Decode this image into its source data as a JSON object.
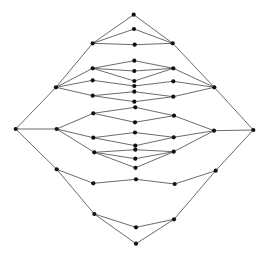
{
  "diagram": {
    "type": "lattice-graph",
    "colors": {
      "background": "#ffffff",
      "edge": "#5a5a5a",
      "node": "#111111"
    },
    "node_radius": 2.1,
    "nodes": [
      {
        "id": "n0",
        "x": 133.7,
        "y": 14.7
      },
      {
        "id": "n1",
        "x": 134.0,
        "y": 29.0
      },
      {
        "id": "n2",
        "x": 92.7,
        "y": 43.3
      },
      {
        "id": "n3",
        "x": 172.7,
        "y": 43.3
      },
      {
        "id": "n4",
        "x": 134.7,
        "y": 44.7
      },
      {
        "id": "n5",
        "x": 134.3,
        "y": 60.7
      },
      {
        "id": "n6",
        "x": 92.7,
        "y": 68.3
      },
      {
        "id": "n7",
        "x": 173.3,
        "y": 68.3
      },
      {
        "id": "n8",
        "x": 134.3,
        "y": 71.0
      },
      {
        "id": "n9",
        "x": 92.7,
        "y": 80.3
      },
      {
        "id": "n10",
        "x": 134.3,
        "y": 81.0
      },
      {
        "id": "n11",
        "x": 173.3,
        "y": 81.3
      },
      {
        "id": "n12",
        "x": 134.3,
        "y": 86.0
      },
      {
        "id": "n13",
        "x": 56.0,
        "y": 87.3
      },
      {
        "id": "n14",
        "x": 214.3,
        "y": 87.3
      },
      {
        "id": "n15",
        "x": 134.3,
        "y": 91.7
      },
      {
        "id": "n16",
        "x": 92.7,
        "y": 95.7
      },
      {
        "id": "n17",
        "x": 173.3,
        "y": 96.7
      },
      {
        "id": "n18",
        "x": 134.3,
        "y": 101.7
      },
      {
        "id": "n19",
        "x": 135.3,
        "y": 107.3
      },
      {
        "id": "n20",
        "x": 93.3,
        "y": 113.3
      },
      {
        "id": "n21",
        "x": 174.0,
        "y": 115.7
      },
      {
        "id": "n22",
        "x": 135.0,
        "y": 122.3
      },
      {
        "id": "n23",
        "x": 15.7,
        "y": 129.0
      },
      {
        "id": "n24",
        "x": 56.7,
        "y": 129.0
      },
      {
        "id": "n25",
        "x": 214.0,
        "y": 130.7
      },
      {
        "id": "n26",
        "x": 253.3,
        "y": 130.0
      },
      {
        "id": "n27",
        "x": 135.0,
        "y": 132.5
      },
      {
        "id": "n28",
        "x": 93.3,
        "y": 137.7
      },
      {
        "id": "n29",
        "x": 173.7,
        "y": 137.3
      },
      {
        "id": "n30",
        "x": 135.3,
        "y": 145.7
      },
      {
        "id": "n31",
        "x": 135.3,
        "y": 149.7
      },
      {
        "id": "n32",
        "x": 94.3,
        "y": 152.3
      },
      {
        "id": "n33",
        "x": 173.7,
        "y": 151.7
      },
      {
        "id": "n34",
        "x": 135.3,
        "y": 158.7
      },
      {
        "id": "n35",
        "x": 135.5,
        "y": 167.8
      },
      {
        "id": "n36",
        "x": 56.7,
        "y": 169.3
      },
      {
        "id": "n37",
        "x": 215.7,
        "y": 170.7
      },
      {
        "id": "n38",
        "x": 136.0,
        "y": 179.3
      },
      {
        "id": "n39",
        "x": 93.3,
        "y": 183.3
      },
      {
        "id": "n40",
        "x": 174.7,
        "y": 184.0
      },
      {
        "id": "n41",
        "x": 94.3,
        "y": 214.0
      },
      {
        "id": "n42",
        "x": 174.0,
        "y": 219.3
      },
      {
        "id": "n43",
        "x": 136.0,
        "y": 227.3
      },
      {
        "id": "n44",
        "x": 136.0,
        "y": 243.7
      }
    ],
    "edges": [
      [
        "n0",
        "n2"
      ],
      [
        "n0",
        "n3"
      ],
      [
        "n1",
        "n2"
      ],
      [
        "n1",
        "n3"
      ],
      [
        "n4",
        "n2"
      ],
      [
        "n4",
        "n3"
      ],
      [
        "n2",
        "n13"
      ],
      [
        "n13",
        "n23"
      ],
      [
        "n3",
        "n14"
      ],
      [
        "n14",
        "n26"
      ],
      [
        "n13",
        "n6"
      ],
      [
        "n13",
        "n9"
      ],
      [
        "n13",
        "n16"
      ],
      [
        "n14",
        "n7"
      ],
      [
        "n14",
        "n11"
      ],
      [
        "n14",
        "n17"
      ],
      [
        "n6",
        "n5"
      ],
      [
        "n6",
        "n8"
      ],
      [
        "n6",
        "n10"
      ],
      [
        "n7",
        "n5"
      ],
      [
        "n7",
        "n8"
      ],
      [
        "n7",
        "n10"
      ],
      [
        "n9",
        "n12"
      ],
      [
        "n11",
        "n12"
      ],
      [
        "n16",
        "n15"
      ],
      [
        "n16",
        "n18"
      ],
      [
        "n17",
        "n15"
      ],
      [
        "n17",
        "n18"
      ],
      [
        "n20",
        "n19"
      ],
      [
        "n20",
        "n22"
      ],
      [
        "n21",
        "n19"
      ],
      [
        "n21",
        "n22"
      ],
      [
        "n24",
        "n20"
      ],
      [
        "n25",
        "n21"
      ],
      [
        "n23",
        "n24"
      ],
      [
        "n25",
        "n26"
      ],
      [
        "n24",
        "n28"
      ],
      [
        "n24",
        "n32"
      ],
      [
        "n25",
        "n29"
      ],
      [
        "n25",
        "n33"
      ],
      [
        "n28",
        "n27"
      ],
      [
        "n28",
        "n30"
      ],
      [
        "n29",
        "n27"
      ],
      [
        "n29",
        "n30"
      ],
      [
        "n32",
        "n31"
      ],
      [
        "n32",
        "n34"
      ],
      [
        "n32",
        "n35"
      ],
      [
        "n33",
        "n31"
      ],
      [
        "n33",
        "n34"
      ],
      [
        "n33",
        "n35"
      ],
      [
        "n23",
        "n36"
      ],
      [
        "n26",
        "n37"
      ],
      [
        "n36",
        "n39"
      ],
      [
        "n39",
        "n38"
      ],
      [
        "n38",
        "n40"
      ],
      [
        "n40",
        "n37"
      ],
      [
        "n36",
        "n41"
      ],
      [
        "n41",
        "n44"
      ],
      [
        "n44",
        "n42"
      ],
      [
        "n42",
        "n37"
      ],
      [
        "n41",
        "n43"
      ],
      [
        "n43",
        "n42"
      ]
    ]
  }
}
